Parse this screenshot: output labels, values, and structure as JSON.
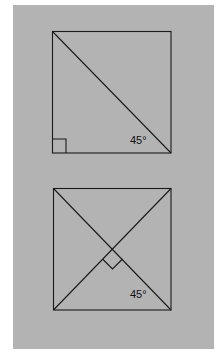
{
  "figures": [
    {
      "name": "square-with-diagonal",
      "angle_label": "45°",
      "right_angle_marker": "corner"
    },
    {
      "name": "square-with-two-diagonals",
      "angle_label": "45°",
      "right_angle_marker": "center"
    }
  ],
  "colors": {
    "background": "#b3b3b3",
    "stroke": "#1a1a1a"
  }
}
